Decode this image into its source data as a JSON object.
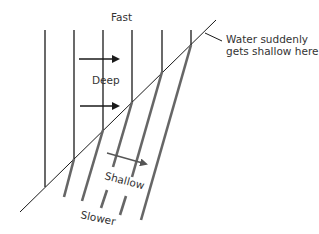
{
  "diagram": {
    "labels": {
      "fast": "Fast",
      "deep": "Deep",
      "annotation_line1": "Water suddenly",
      "annotation_line2": "gets shallow here",
      "shallow": "Shallow",
      "slower": "Slower"
    },
    "colors": {
      "deep_wavefront": "#1a1a1a",
      "shallow_wavefront": "#666666",
      "boundary": "#1a1a1a",
      "arrow": "#1a1a1a",
      "shallow_arrow": "#555555"
    }
  }
}
